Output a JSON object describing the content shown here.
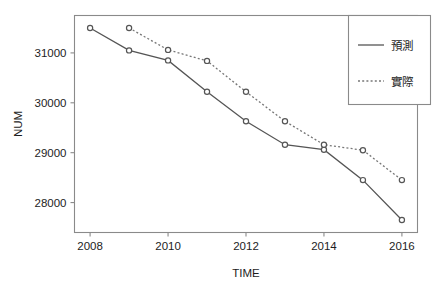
{
  "chart_data": {
    "type": "line",
    "title": "",
    "xlabel": "TIME",
    "ylabel": "NUM",
    "x": [
      2008,
      2009,
      2010,
      2011,
      2012,
      2013,
      2014,
      2015,
      2016
    ],
    "xlim": [
      2007.6,
      2016.4
    ],
    "ylim": [
      27400,
      31750
    ],
    "xticks": [
      2008,
      2010,
      2012,
      2014,
      2016
    ],
    "xtick_labels": [
      "2008",
      "2010",
      "2012",
      "2014",
      "2016"
    ],
    "yticks": [
      28000,
      29000,
      30000,
      31000
    ],
    "ytick_labels": [
      "28000",
      "29000",
      "30000",
      "31000"
    ],
    "grid": false,
    "legend_position": "top-right",
    "series": [
      {
        "name": "預測",
        "style": "solid",
        "marker": "circle",
        "color": "#555555",
        "x": [
          2008,
          2009,
          2010,
          2011,
          2012,
          2013,
          2014,
          2015,
          2016
        ],
        "values": [
          31500,
          31050,
          30850,
          30220,
          29630,
          29160,
          29060,
          28450,
          27650
        ]
      },
      {
        "name": "實際",
        "style": "dotted",
        "marker": "circle",
        "color": "#777777",
        "x": [
          2009,
          2010,
          2011,
          2012,
          2013,
          2014,
          2015,
          2016
        ],
        "values": [
          31500,
          31060,
          30840,
          30220,
          29630,
          29160,
          29050,
          28450
        ]
      }
    ]
  },
  "axes": {
    "x_title": "TIME",
    "y_title": "NUM"
  },
  "legend": {
    "entries": [
      {
        "label": "預測",
        "style": "solid"
      },
      {
        "label": "實際",
        "style": "dotted"
      }
    ]
  }
}
